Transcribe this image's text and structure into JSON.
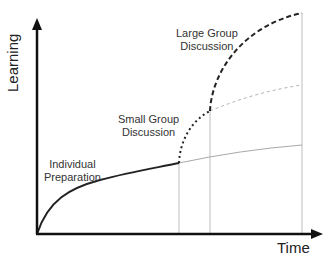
{
  "diagram": {
    "axes": {
      "x_label": "Time",
      "y_label": "Learning"
    },
    "phases": [
      {
        "label_line1": "Individual",
        "label_line2": "Preparation",
        "line_style": "solid"
      },
      {
        "label_line1": "Small Group",
        "label_line2": "Discussion",
        "line_style": "dotted"
      },
      {
        "label_line1": "Large Group",
        "label_line2": "Discussion",
        "line_style": "dashed"
      }
    ],
    "colors": {
      "axis": "#111111",
      "main_curve": "#222222",
      "faded_curve": "#aaaaaa",
      "guide_lines": "#bbbbbb"
    }
  }
}
